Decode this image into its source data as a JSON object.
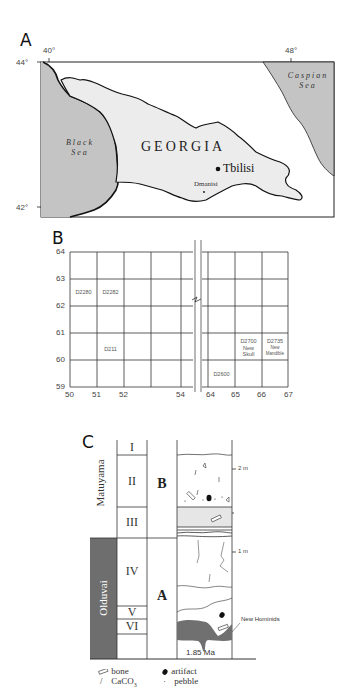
{
  "panel_a": {
    "label": "A",
    "lon_ticks": [
      "40°",
      "48°"
    ],
    "lat_ticks": [
      "44°",
      "42°"
    ],
    "country": "GEORGIA",
    "seas": [
      {
        "line1": "Black",
        "line2": "Sea"
      },
      {
        "line1": "Caspian",
        "line2": "Sea"
      }
    ],
    "cities": {
      "capital": "Tbilisi",
      "site": "Dmanisi"
    },
    "colors": {
      "sea": "#c4c4c4",
      "land": "#ececec",
      "border": "#111111"
    }
  },
  "panel_b": {
    "label": "B",
    "y_ticks": [
      "64",
      "63",
      "62",
      "61",
      "60",
      "59"
    ],
    "x_ticks": [
      "50",
      "51",
      "52",
      "54",
      "64",
      "65",
      "66",
      "67"
    ],
    "cells": [
      {
        "id": "D2280",
        "line2": "",
        "line3": ""
      },
      {
        "id": "D2282",
        "line2": "",
        "line3": ""
      },
      {
        "id": "D211",
        "line2": "",
        "line3": ""
      },
      {
        "id": "D2600",
        "line2": "",
        "line3": ""
      },
      {
        "id": "D2700",
        "line2": "New",
        "line3": "Skull"
      },
      {
        "id": "D2735",
        "line2": "New",
        "line3": "Mandible"
      }
    ]
  },
  "panel_c": {
    "label": "C",
    "chrons": {
      "upper": "Matuyama",
      "lower": "Olduvai"
    },
    "units": [
      "I",
      "II",
      "III",
      "IV",
      "V",
      "VI"
    ],
    "groups": [
      "B",
      "A"
    ],
    "scale": [
      "2 m",
      "1 m"
    ],
    "date": "1.85 Ma",
    "annotation": "New Hominids",
    "legend": [
      {
        "icon": "bone",
        "label": "bone"
      },
      {
        "icon": "artifact",
        "label": "artifact"
      },
      {
        "icon": "caco3",
        "label": "CaCO",
        "sub": "3"
      },
      {
        "icon": "pebble",
        "label": "pebble"
      }
    ],
    "colors": {
      "olduvai": "#6e6e6e",
      "paleosol": "#707070",
      "band": "#e6e6e6"
    }
  }
}
